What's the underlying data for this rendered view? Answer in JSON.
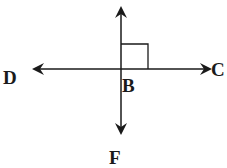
{
  "diagram": {
    "type": "perpendicular-lines",
    "points": {
      "D": "D",
      "C": "C",
      "B": "B",
      "F": "F"
    },
    "lines": [
      {
        "name": "line-DC",
        "from": "D",
        "to": "C",
        "orientation": "horizontal",
        "arrows": "both"
      },
      {
        "name": "line-vertical",
        "through": "B",
        "to": "F",
        "orientation": "vertical",
        "arrows": "both"
      }
    ],
    "right_angle_at": "B",
    "stroke_color": "#1a1a1a"
  }
}
